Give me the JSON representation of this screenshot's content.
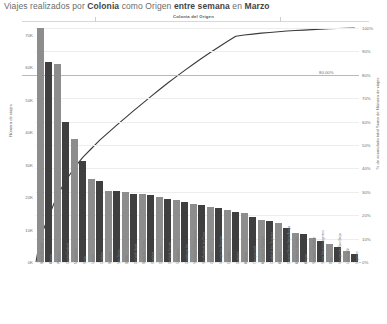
{
  "header": {
    "title_plain_1": "Viajes realizados por ",
    "title_bold_1": "Colonia",
    "title_plain_2": " como Origen ",
    "title_bold_2": "entre semana",
    "title_plain_3": " en ",
    "title_bold_3": "Marzo",
    "title_full": "Viajes realizados por Colonia como Origen entre semana en Marzo"
  },
  "chart_data": {
    "type": "bar",
    "title": "Viajes realizados por Colonia como Origen entre semana en Marzo",
    "subtitle": "Colonia del Origen",
    "xlabel": "Colonia del Origen",
    "ylabel": "Número de viajes",
    "ylabel_secondary": "% de acumulado total Suma de Número de viajes",
    "ylim": [
      0,
      72000
    ],
    "ylim_secondary": [
      0,
      1
    ],
    "grid": true,
    "legend": "none",
    "reference_line": {
      "value": 80,
      "label": "80.00%"
    },
    "ytick_labels": [
      "0K",
      "10K",
      "20K",
      "30K",
      "40K",
      "50K",
      "60K",
      "70K"
    ],
    "ytick_values": [
      0,
      10000,
      20000,
      30000,
      40000,
      50000,
      60000,
      70000
    ],
    "ytick_labels_secondary": [
      "0%",
      "10%",
      "20%",
      "30%",
      "40%",
      "50%",
      "60%",
      "70%",
      "80%",
      "90%",
      "100%"
    ],
    "ytick_values_secondary": [
      0,
      10,
      20,
      30,
      40,
      50,
      60,
      70,
      80,
      90,
      100
    ],
    "bar_colors": [
      "#8d8d8d",
      "#3f3f3f"
    ],
    "line_color": "#3a3a3a",
    "categories": [
      "Barrio Obelisco",
      "Abasto",
      "Palermo",
      "Capital Federal",
      "Microcentro",
      "Retiro",
      "Lomas",
      "Cordoba",
      "Barracas",
      "San Telmo",
      "Boedo",
      "Del Valle Norte",
      "Barrio del Centro",
      "Recoleta",
      "Del Valle Sur",
      "Del Valle Centro",
      "Tabacalera",
      "Guadalupe Inn",
      "San Miguel Chapultepec",
      "San Pedro de los Pinos",
      "Granada",
      "Insurgentes Mixcoac",
      "Escandon",
      "Doctores",
      "Anahuac",
      "Tlacopanuxtli",
      "Ampliacion Granada",
      "Ciudad de los Deportes",
      "Atlampa",
      "General Pedro Maria Anaya",
      "Ampliacion Napoles",
      "Actipan",
      "Nonoalco Tlatelolco",
      "Santa Maria Insurgentes",
      "Xoco",
      "Insurgentes San Borja",
      "Letran Valle",
      "Irrigacion"
    ],
    "values": [
      72000,
      61500,
      61000,
      43000,
      38000,
      31000,
      25500,
      25000,
      22000,
      21800,
      21500,
      21000,
      21000,
      20500,
      20000,
      19500,
      19000,
      18500,
      18000,
      17500,
      17000,
      16500,
      16000,
      15500,
      15000,
      14000,
      13000,
      12500,
      12000,
      10500,
      9000,
      8500,
      7500,
      6500,
      5500,
      4500,
      3500,
      2500
    ],
    "cumulative_percent": [
      10.5,
      19.5,
      28.4,
      34.7,
      40.2,
      44.7,
      48.4,
      52.1,
      55.3,
      58.5,
      61.6,
      64.7,
      67.7,
      70.7,
      73.6,
      76.5,
      79.2,
      81.9,
      84.5,
      87.1,
      89.5,
      91.9,
      94.2,
      96.5,
      97.0,
      97.4,
      97.8,
      98.1,
      98.4,
      98.7,
      98.9,
      99.1,
      99.3,
      99.5,
      99.65,
      99.8,
      99.9,
      100.0
    ]
  }
}
